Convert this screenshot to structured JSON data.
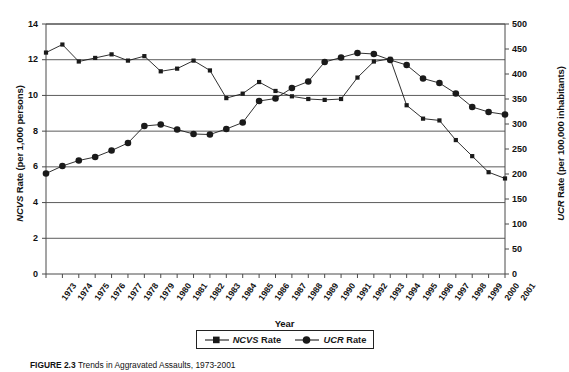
{
  "chart_data": {
    "type": "line",
    "title": "Trends in Aggravated Assaults, 1973-2001",
    "xlabel": "Year",
    "categories": [
      "1973",
      "1974",
      "1975",
      "1976",
      "1977",
      "1978",
      "1979",
      "1980",
      "1981",
      "1982",
      "1983",
      "1984",
      "1985",
      "1986",
      "1987",
      "1988",
      "1989",
      "1990",
      "1991",
      "1992",
      "1993",
      "1994",
      "1995",
      "1996",
      "1997",
      "1998",
      "1999",
      "2000",
      "2001"
    ],
    "grid": true,
    "legend_position": "bottom",
    "axes": {
      "left": {
        "label": "NCVS Rate (per 1,000 persons)",
        "label_italic_prefix": "NCVS",
        "label_rest": " Rate (per 1,000 persons)",
        "min": 0,
        "max": 14,
        "step": 2,
        "ticks": [
          "0",
          "2",
          "4",
          "6",
          "8",
          "10",
          "12",
          "14"
        ]
      },
      "right": {
        "label": "UCR Rate (per 100,000 inhabitants)",
        "label_italic_prefix": "UCR",
        "label_rest": " Rate (per 100,000 inhabitants)",
        "min": 0,
        "max": 500,
        "step": 50,
        "ticks": [
          "0",
          "50",
          "100",
          "150",
          "200",
          "250",
          "300",
          "350",
          "400",
          "450",
          "500"
        ]
      }
    },
    "series": [
      {
        "name": "NCVS Rate",
        "name_italic_prefix": "NCVS",
        "name_rest": " Rate",
        "axis": "left",
        "marker": "square",
        "color": "#1a1a1a",
        "values": [
          12.4,
          12.85,
          11.9,
          12.1,
          12.3,
          11.95,
          12.2,
          11.35,
          11.5,
          11.95,
          11.4,
          9.85,
          10.1,
          10.75,
          10.25,
          9.95,
          9.8,
          9.75,
          9.8,
          11.0,
          11.9,
          12.05,
          9.45,
          8.7,
          8.6,
          7.5,
          6.6,
          5.7,
          5.35
        ]
      },
      {
        "name": "UCR Rate",
        "name_italic_prefix": "UCR",
        "name_rest": " Rate",
        "axis": "right",
        "marker": "circle",
        "color": "#1a1a1a",
        "values": [
          201,
          216,
          227,
          234,
          247,
          262,
          296,
          299,
          289,
          280,
          279,
          290,
          303,
          346,
          351,
          372,
          385,
          424,
          433,
          442,
          440,
          428,
          418,
          391,
          382,
          361,
          334,
          324,
          319
        ]
      }
    ]
  },
  "caption": {
    "lead": "FIGURE 2.3",
    "body": "Trends in Aggravated Assaults, 1973-2001"
  }
}
